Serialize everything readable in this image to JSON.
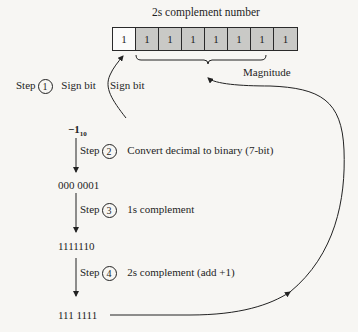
{
  "title": "2s complement number",
  "register": {
    "bits": [
      "1",
      "1",
      "1",
      "1",
      "1",
      "1",
      "1",
      "1"
    ],
    "sign_label": "Sign bit",
    "magnitude_label": "Magnitude"
  },
  "steps": [
    {
      "label": "Step",
      "number": "1",
      "description": "Sign bit"
    },
    {
      "label": "Step",
      "number": "2",
      "description": "Convert decimal to binary (7-bit)"
    },
    {
      "label": "Step",
      "number": "3",
      "description": "1s complement"
    },
    {
      "label": "Step",
      "number": "4",
      "description": "2s complement (add +1)"
    }
  ],
  "values": {
    "start": "−1",
    "start_base": "10",
    "binary": "000 0001",
    "ones_complement": "1111110",
    "twos_complement": "111 1111"
  }
}
